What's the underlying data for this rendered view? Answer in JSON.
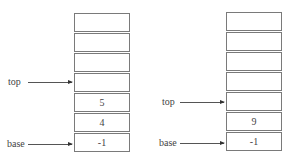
{
  "diagram": {
    "left_stack": {
      "cells": [
        "",
        "",
        "",
        "",
        "5",
        "4",
        "-1"
      ],
      "pointers": {
        "top": "top",
        "base": "base"
      }
    },
    "right_stack": {
      "cells": [
        "",
        "",
        "",
        "",
        "",
        "9",
        "-1"
      ],
      "pointers": {
        "top": "top",
        "base": "base"
      }
    }
  }
}
